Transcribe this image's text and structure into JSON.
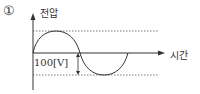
{
  "diagram": {
    "option_marker": "①",
    "y_axis_label": "전압",
    "x_axis_label": "시간",
    "amplitude_label": "100[V]",
    "waveform": "sine",
    "colors": {
      "line": "#333333",
      "dotted": "#555555"
    }
  }
}
